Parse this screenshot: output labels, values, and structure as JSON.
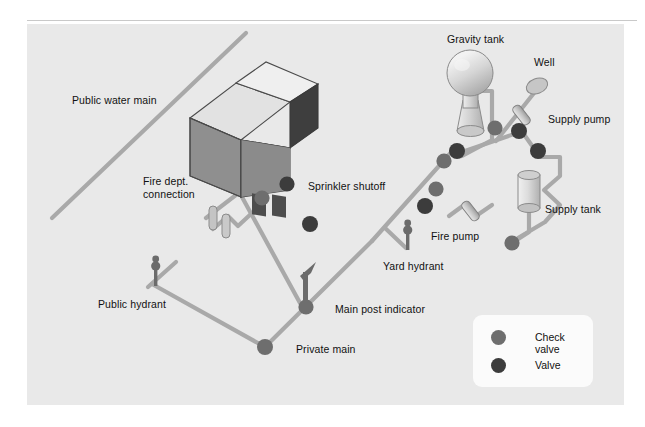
{
  "diagram": {
    "background_color": "#e9e9e9",
    "pipe_color": "#a9a9a9",
    "labels": {
      "public_water_main": "Public water main",
      "fire_dept_connection": "Fire dept.\nconnection",
      "fire_dept_connection_line1": "Fire dept.",
      "fire_dept_connection_line2": "connection",
      "sprinkler_shutoff": "Sprinkler shutoff",
      "gravity_tank": "Gravity tank",
      "well": "Well",
      "supply_pump": "Supply pump",
      "supply_tank": "Supply tank",
      "fire_pump": "Fire pump",
      "yard_hydrant": "Yard hydrant",
      "public_hydrant": "Public hydrant",
      "main_post_indicator": "Main post indicator",
      "private_main": "Private main"
    }
  },
  "legend": {
    "items": [
      {
        "label": "Check valve",
        "color": "#6e6e6e"
      },
      {
        "label": "Valve",
        "color": "#3c3c3c"
      }
    ]
  },
  "components": [
    {
      "name": "building",
      "type": "isometric-house"
    },
    {
      "name": "gravity-tank",
      "type": "sphere-on-stand"
    },
    {
      "name": "supply-tank",
      "type": "cylinder"
    },
    {
      "name": "well",
      "type": "ellipse"
    },
    {
      "name": "supply-pump",
      "type": "angled-capsule"
    },
    {
      "name": "fire-pump",
      "type": "angled-capsule"
    },
    {
      "name": "fire-dept-connection",
      "type": "twin-risers"
    },
    {
      "name": "public-hydrant",
      "type": "hydrant"
    },
    {
      "name": "yard-hydrant",
      "type": "hydrant"
    },
    {
      "name": "main-post-indicator",
      "type": "post-indicator"
    }
  ]
}
